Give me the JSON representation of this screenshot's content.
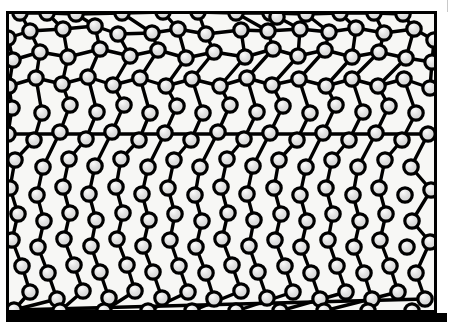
{
  "figure": {
    "kind": "node-link diagram",
    "canvas": {
      "width": 459,
      "height": 334
    },
    "colors": {
      "background": "#ffffff",
      "plot_background": "#f7f7f5",
      "ink": "#000000",
      "node_fill": "#d9d9d9",
      "node_highlight": "#f2f2f2",
      "node_stroke": "#000000",
      "edge_stroke": "#000000",
      "page_edge": "#c9c9c9"
    },
    "frame": {
      "x": 6,
      "y": 11,
      "width": 431,
      "height": 302,
      "top_border_px": 3,
      "left_border_px": 3,
      "right_border_px": 3,
      "bottom_bar_px": 9
    },
    "bottom_bar": {
      "x": 6,
      "y": 313,
      "width": 441,
      "height": 9
    },
    "page_edge_line": {
      "x": 447,
      "y": 0,
      "height": 12
    },
    "node_radius": 7.2,
    "node_stroke_width": 3.2,
    "edge_stroke_width": 3.4
  },
  "chart_data": {
    "type": "scatter",
    "title": "",
    "xlabel": "",
    "ylabel": "",
    "grid": false,
    "legend": null,
    "xlim": [
      6,
      437
    ],
    "ylim": [
      11,
      313
    ],
    "node_count": 196,
    "edge_count": 213,
    "nodes": [
      [
        20,
        13
      ],
      [
        47,
        13
      ],
      [
        76,
        14
      ],
      [
        122,
        13
      ],
      [
        163,
        12
      ],
      [
        198,
        12
      ],
      [
        236,
        13
      ],
      [
        270,
        13
      ],
      [
        277,
        17
      ],
      [
        306,
        14
      ],
      [
        340,
        13
      ],
      [
        374,
        13
      ],
      [
        403,
        14
      ],
      [
        8,
        38
      ],
      [
        30,
        31
      ],
      [
        63,
        29
      ],
      [
        95,
        26
      ],
      [
        118,
        34
      ],
      [
        152,
        33
      ],
      [
        178,
        29
      ],
      [
        206,
        34
      ],
      [
        241,
        30
      ],
      [
        268,
        31
      ],
      [
        300,
        29
      ],
      [
        329,
        32
      ],
      [
        356,
        28
      ],
      [
        384,
        33
      ],
      [
        414,
        29
      ],
      [
        434,
        40
      ],
      [
        13,
        60
      ],
      [
        40,
        52
      ],
      [
        68,
        57
      ],
      [
        100,
        49
      ],
      [
        130,
        56
      ],
      [
        158,
        50
      ],
      [
        186,
        58
      ],
      [
        214,
        52
      ],
      [
        245,
        57
      ],
      [
        273,
        49
      ],
      [
        298,
        56
      ],
      [
        325,
        50
      ],
      [
        352,
        57
      ],
      [
        379,
        52
      ],
      [
        406,
        58
      ],
      [
        432,
        62
      ],
      [
        9,
        86
      ],
      [
        36,
        78
      ],
      [
        62,
        84
      ],
      [
        88,
        77
      ],
      [
        113,
        85
      ],
      [
        140,
        78
      ],
      [
        166,
        86
      ],
      [
        192,
        79
      ],
      [
        220,
        86
      ],
      [
        247,
        78
      ],
      [
        272,
        85
      ],
      [
        299,
        79
      ],
      [
        326,
        86
      ],
      [
        352,
        79
      ],
      [
        378,
        86
      ],
      [
        404,
        79
      ],
      [
        430,
        88
      ],
      [
        12,
        108
      ],
      [
        42,
        113
      ],
      [
        70,
        105
      ],
      [
        97,
        112
      ],
      [
        124,
        105
      ],
      [
        150,
        113
      ],
      [
        177,
        106
      ],
      [
        203,
        113
      ],
      [
        230,
        105
      ],
      [
        257,
        112
      ],
      [
        283,
        106
      ],
      [
        310,
        113
      ],
      [
        336,
        105
      ],
      [
        363,
        112
      ],
      [
        389,
        106
      ],
      [
        416,
        113
      ],
      [
        8,
        134
      ],
      [
        34,
        140
      ],
      [
        60,
        132
      ],
      [
        86,
        139
      ],
      [
        112,
        132
      ],
      [
        139,
        140
      ],
      [
        165,
        133
      ],
      [
        191,
        140
      ],
      [
        218,
        132
      ],
      [
        244,
        139
      ],
      [
        270,
        133
      ],
      [
        297,
        140
      ],
      [
        323,
        133
      ],
      [
        349,
        140
      ],
      [
        376,
        133
      ],
      [
        402,
        140
      ],
      [
        428,
        134
      ],
      [
        15,
        160
      ],
      [
        43,
        167
      ],
      [
        69,
        159
      ],
      [
        95,
        166
      ],
      [
        121,
        159
      ],
      [
        148,
        167
      ],
      [
        174,
        160
      ],
      [
        200,
        167
      ],
      [
        227,
        159
      ],
      [
        253,
        166
      ],
      [
        279,
        160
      ],
      [
        306,
        167
      ],
      [
        332,
        160
      ],
      [
        358,
        167
      ],
      [
        385,
        160
      ],
      [
        411,
        167
      ],
      [
        10,
        188
      ],
      [
        37,
        195
      ],
      [
        63,
        187
      ],
      [
        89,
        194
      ],
      [
        116,
        187
      ],
      [
        142,
        194
      ],
      [
        168,
        188
      ],
      [
        195,
        195
      ],
      [
        221,
        187
      ],
      [
        247,
        194
      ],
      [
        274,
        188
      ],
      [
        300,
        195
      ],
      [
        326,
        188
      ],
      [
        353,
        195
      ],
      [
        379,
        188
      ],
      [
        405,
        195
      ],
      [
        431,
        190
      ],
      [
        18,
        214
      ],
      [
        44,
        221
      ],
      [
        70,
        213
      ],
      [
        96,
        220
      ],
      [
        123,
        213
      ],
      [
        149,
        220
      ],
      [
        175,
        214
      ],
      [
        202,
        221
      ],
      [
        228,
        213
      ],
      [
        254,
        220
      ],
      [
        281,
        214
      ],
      [
        307,
        221
      ],
      [
        333,
        214
      ],
      [
        360,
        221
      ],
      [
        386,
        214
      ],
      [
        412,
        221
      ],
      [
        12,
        240
      ],
      [
        38,
        247
      ],
      [
        64,
        239
      ],
      [
        91,
        246
      ],
      [
        117,
        239
      ],
      [
        143,
        246
      ],
      [
        170,
        240
      ],
      [
        196,
        247
      ],
      [
        222,
        239
      ],
      [
        249,
        246
      ],
      [
        275,
        240
      ],
      [
        301,
        247
      ],
      [
        328,
        240
      ],
      [
        354,
        247
      ],
      [
        380,
        240
      ],
      [
        407,
        247
      ],
      [
        430,
        242
      ],
      [
        22,
        266
      ],
      [
        48,
        273
      ],
      [
        74,
        265
      ],
      [
        100,
        272
      ],
      [
        127,
        265
      ],
      [
        153,
        272
      ],
      [
        179,
        266
      ],
      [
        206,
        273
      ],
      [
        232,
        265
      ],
      [
        258,
        272
      ],
      [
        285,
        266
      ],
      [
        311,
        273
      ],
      [
        337,
        266
      ],
      [
        364,
        273
      ],
      [
        390,
        266
      ],
      [
        416,
        273
      ],
      [
        30,
        292
      ],
      [
        57,
        299
      ],
      [
        83,
        291
      ],
      [
        109,
        298
      ],
      [
        135,
        291
      ],
      [
        162,
        298
      ],
      [
        188,
        292
      ],
      [
        214,
        299
      ],
      [
        241,
        291
      ],
      [
        267,
        298
      ],
      [
        293,
        292
      ],
      [
        320,
        299
      ],
      [
        346,
        292
      ],
      [
        372,
        299
      ],
      [
        398,
        292
      ],
      [
        425,
        299
      ],
      [
        14,
        310
      ],
      [
        60,
        311
      ],
      [
        104,
        311
      ],
      [
        148,
        311
      ],
      [
        192,
        311
      ],
      [
        236,
        311
      ],
      [
        280,
        311
      ],
      [
        324,
        311
      ],
      [
        368,
        311
      ],
      [
        412,
        311
      ]
    ],
    "edges": [
      [
        0,
        1
      ],
      [
        1,
        2
      ],
      [
        2,
        3
      ],
      [
        3,
        4
      ],
      [
        4,
        5
      ],
      [
        5,
        6
      ],
      [
        6,
        7
      ],
      [
        7,
        9
      ],
      [
        9,
        10
      ],
      [
        10,
        11
      ],
      [
        11,
        12
      ],
      [
        0,
        14
      ],
      [
        1,
        15
      ],
      [
        2,
        16
      ],
      [
        3,
        18
      ],
      [
        4,
        19
      ],
      [
        5,
        20
      ],
      [
        6,
        22
      ],
      [
        7,
        23
      ],
      [
        9,
        24
      ],
      [
        10,
        25
      ],
      [
        11,
        26
      ],
      [
        12,
        27
      ],
      [
        13,
        14
      ],
      [
        14,
        15
      ],
      [
        15,
        16
      ],
      [
        16,
        17
      ],
      [
        17,
        18
      ],
      [
        18,
        19
      ],
      [
        19,
        20
      ],
      [
        20,
        21
      ],
      [
        21,
        22
      ],
      [
        22,
        23
      ],
      [
        23,
        24
      ],
      [
        24,
        25
      ],
      [
        25,
        26
      ],
      [
        26,
        27
      ],
      [
        27,
        28
      ],
      [
        13,
        29
      ],
      [
        14,
        30
      ],
      [
        15,
        31
      ],
      [
        16,
        32
      ],
      [
        17,
        33
      ],
      [
        18,
        34
      ],
      [
        19,
        35
      ],
      [
        20,
        36
      ],
      [
        21,
        37
      ],
      [
        22,
        38
      ],
      [
        23,
        39
      ],
      [
        24,
        40
      ],
      [
        25,
        41
      ],
      [
        26,
        42
      ],
      [
        27,
        43
      ],
      [
        28,
        44
      ],
      [
        29,
        30
      ],
      [
        30,
        31
      ],
      [
        31,
        32
      ],
      [
        32,
        33
      ],
      [
        33,
        34
      ],
      [
        34,
        35
      ],
      [
        35,
        36
      ],
      [
        36,
        37
      ],
      [
        37,
        38
      ],
      [
        38,
        39
      ],
      [
        39,
        40
      ],
      [
        40,
        41
      ],
      [
        41,
        42
      ],
      [
        42,
        43
      ],
      [
        43,
        44
      ],
      [
        29,
        45
      ],
      [
        30,
        46
      ],
      [
        31,
        47
      ],
      [
        32,
        48
      ],
      [
        33,
        49
      ],
      [
        34,
        50
      ],
      [
        35,
        51
      ],
      [
        36,
        52
      ],
      [
        37,
        53
      ],
      [
        38,
        54
      ],
      [
        39,
        55
      ],
      [
        40,
        56
      ],
      [
        41,
        57
      ],
      [
        42,
        58
      ],
      [
        43,
        59
      ],
      [
        44,
        61
      ],
      [
        45,
        46
      ],
      [
        46,
        47
      ],
      [
        47,
        48
      ],
      [
        48,
        49
      ],
      [
        49,
        50
      ],
      [
        50,
        51
      ],
      [
        51,
        52
      ],
      [
        52,
        53
      ],
      [
        53,
        54
      ],
      [
        54,
        55
      ],
      [
        55,
        56
      ],
      [
        56,
        57
      ],
      [
        57,
        58
      ],
      [
        58,
        59
      ],
      [
        59,
        60
      ],
      [
        60,
        61
      ],
      [
        45,
        62
      ],
      [
        46,
        63
      ],
      [
        47,
        64
      ],
      [
        48,
        65
      ],
      [
        49,
        66
      ],
      [
        50,
        67
      ],
      [
        51,
        68
      ],
      [
        52,
        69
      ],
      [
        53,
        70
      ],
      [
        54,
        71
      ],
      [
        55,
        72
      ],
      [
        56,
        73
      ],
      [
        57,
        74
      ],
      [
        58,
        75
      ],
      [
        59,
        76
      ],
      [
        60,
        77
      ],
      [
        62,
        78
      ],
      [
        63,
        79
      ],
      [
        64,
        80
      ],
      [
        65,
        81
      ],
      [
        66,
        82
      ],
      [
        67,
        83
      ],
      [
        68,
        84
      ],
      [
        69,
        85
      ],
      [
        70,
        86
      ],
      [
        71,
        87
      ],
      [
        72,
        88
      ],
      [
        73,
        89
      ],
      [
        74,
        90
      ],
      [
        75,
        91
      ],
      [
        76,
        92
      ],
      [
        77,
        93
      ],
      [
        78,
        94
      ],
      [
        79,
        95
      ],
      [
        80,
        96
      ],
      [
        81,
        97
      ],
      [
        82,
        98
      ],
      [
        83,
        99
      ],
      [
        84,
        100
      ],
      [
        85,
        101
      ],
      [
        86,
        102
      ],
      [
        87,
        103
      ],
      [
        88,
        104
      ],
      [
        89,
        105
      ],
      [
        90,
        106
      ],
      [
        91,
        107
      ],
      [
        92,
        108
      ],
      [
        93,
        109
      ],
      [
        94,
        110
      ],
      [
        95,
        111
      ],
      [
        96,
        112
      ],
      [
        97,
        113
      ],
      [
        98,
        114
      ],
      [
        99,
        115
      ],
      [
        100,
        116
      ],
      [
        101,
        117
      ],
      [
        102,
        118
      ],
      [
        103,
        119
      ],
      [
        104,
        120
      ],
      [
        105,
        121
      ],
      [
        106,
        122
      ],
      [
        107,
        123
      ],
      [
        108,
        124
      ],
      [
        109,
        125
      ],
      [
        110,
        127
      ],
      [
        111,
        128
      ],
      [
        112,
        129
      ],
      [
        113,
        130
      ],
      [
        114,
        131
      ],
      [
        115,
        132
      ],
      [
        116,
        133
      ],
      [
        117,
        134
      ],
      [
        118,
        135
      ],
      [
        119,
        136
      ],
      [
        120,
        137
      ],
      [
        121,
        138
      ],
      [
        122,
        139
      ],
      [
        123,
        140
      ],
      [
        124,
        141
      ],
      [
        125,
        142
      ],
      [
        127,
        143
      ],
      [
        128,
        144
      ],
      [
        129,
        145
      ],
      [
        130,
        146
      ],
      [
        131,
        147
      ],
      [
        132,
        148
      ],
      [
        133,
        149
      ],
      [
        134,
        150
      ],
      [
        135,
        151
      ],
      [
        136,
        152
      ],
      [
        137,
        153
      ],
      [
        138,
        154
      ],
      [
        139,
        155
      ],
      [
        140,
        156
      ],
      [
        141,
        157
      ],
      [
        142,
        158
      ],
      [
        143,
        160
      ],
      [
        144,
        161
      ],
      [
        145,
        162
      ],
      [
        146,
        163
      ],
      [
        147,
        164
      ],
      [
        148,
        165
      ],
      [
        149,
        166
      ],
      [
        150,
        167
      ],
      [
        151,
        168
      ],
      [
        152,
        169
      ],
      [
        153,
        170
      ],
      [
        154,
        171
      ],
      [
        155,
        172
      ],
      [
        156,
        173
      ],
      [
        157,
        174
      ],
      [
        158,
        175
      ],
      [
        160,
        176
      ],
      [
        161,
        177
      ],
      [
        162,
        178
      ],
      [
        163,
        179
      ],
      [
        164,
        180
      ],
      [
        165,
        181
      ],
      [
        166,
        182
      ],
      [
        167,
        183
      ],
      [
        168,
        184
      ],
      [
        169,
        185
      ],
      [
        170,
        186
      ],
      [
        171,
        187
      ],
      [
        172,
        188
      ],
      [
        173,
        189
      ],
      [
        174,
        190
      ],
      [
        175,
        191
      ],
      [
        176,
        192
      ],
      [
        177,
        193
      ],
      [
        178,
        193
      ],
      [
        179,
        194
      ],
      [
        181,
        195
      ],
      [
        183,
        196
      ],
      [
        185,
        197
      ],
      [
        187,
        198
      ],
      [
        189,
        199
      ],
      [
        191,
        200
      ],
      [
        192,
        193
      ],
      [
        194,
        195
      ]
    ]
  }
}
